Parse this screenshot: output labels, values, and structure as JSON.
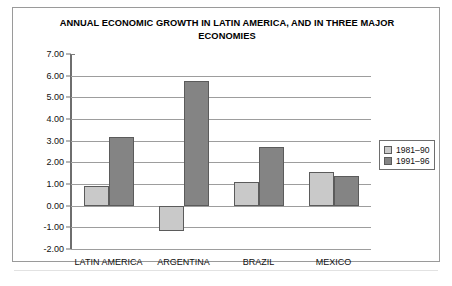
{
  "figure": {
    "title": "ANNUAL ECONOMIC GROWTH IN LATIN AMERICA, AND IN THREE MAJOR ECONOMIES",
    "border_color": "#9a9a9a",
    "background": "#ffffff"
  },
  "legend": {
    "position": "right",
    "entries": [
      {
        "label": "1981–90",
        "color": "#c9c9c9"
      },
      {
        "label": "1991–96",
        "color": "#848484"
      }
    ]
  },
  "chart_data": {
    "type": "bar",
    "title": "ANNUAL ECONOMIC GROWTH IN LATIN AMERICA, AND IN THREE MAJOR ECONOMIES",
    "xlabel": "",
    "ylabel": "",
    "categories": [
      "LATIN AMERICA",
      "ARGENTINA",
      "BRAZIL",
      "MEXICO"
    ],
    "series": [
      {
        "name": "1981–90",
        "color": "#c9c9c9",
        "values": [
          0.9,
          -1.15,
          1.1,
          1.55
        ]
      },
      {
        "name": "1991–96",
        "color": "#848484",
        "values": [
          3.15,
          5.75,
          2.7,
          1.35
        ]
      }
    ],
    "ylim": [
      -2.0,
      7.0
    ],
    "ytick_labels": [
      "7.00",
      "6.00",
      "5.00",
      "4.00",
      "3.00",
      "2.00",
      "1.00",
      "0.00",
      "-1.00",
      "-2.00"
    ],
    "ytick_values": [
      7,
      6,
      5,
      4,
      3,
      2,
      1,
      0,
      -1,
      -2
    ],
    "grid": true,
    "grid_axis": "y",
    "legend_position": "right",
    "baseline": 0.0
  }
}
